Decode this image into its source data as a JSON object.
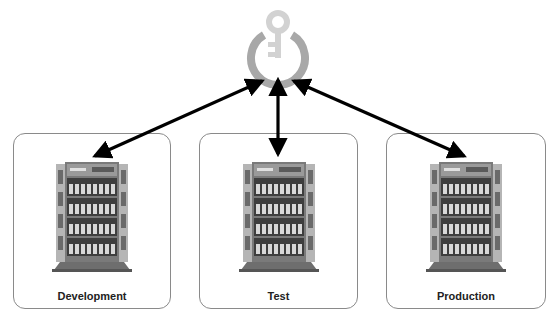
{
  "diagram": {
    "hub": {
      "icon": "key-power-icon",
      "ring_color": "#a8a8a8",
      "key_color": "#d2d2d2"
    },
    "arrow_color": "#000000",
    "environments": [
      {
        "label": "Development",
        "icon": "tower-server-icon"
      },
      {
        "label": "Test",
        "icon": "tower-server-icon"
      },
      {
        "label": "Production",
        "icon": "tower-server-icon"
      }
    ],
    "connections": [
      {
        "from": "hub",
        "to": "Development",
        "direction": "bidirectional"
      },
      {
        "from": "hub",
        "to": "Test",
        "direction": "bidirectional"
      },
      {
        "from": "hub",
        "to": "Production",
        "direction": "bidirectional"
      }
    ]
  }
}
